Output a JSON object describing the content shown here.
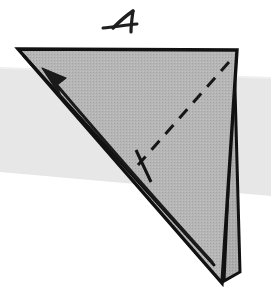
{
  "figure": {
    "title": "Origami fold step 4",
    "step_label": "4",
    "step_label_style": "hand-drawn-numeral",
    "background_color": "#ffffff"
  },
  "colors": {
    "paper_front": "#b3b3b3",
    "paper_front_light": "#bdbdbd",
    "paper_sliver": "#adadad",
    "outline": "#111111",
    "band": "#e7e7e7",
    "band_edge": "#ededed",
    "arrow": "#1a1a1a",
    "crease_dashed": "#161616",
    "label_ink": "#1f1f1f"
  },
  "geometry": {
    "canvas_width": 271,
    "canvas_height": 308,
    "main_triangle": {
      "name": "folded-paper-main-face",
      "points": "18,49 237,50 222,283",
      "description": "Large gray right-triangle shaped folded paper, apex top-left, top-right corner, lower point near bottom"
    },
    "sliver_layer": {
      "name": "folded-paper-back-layer",
      "points": "234,52 240,272 224,281",
      "description": "Narrow second paper layer peeking along right edge, tip at bottom right"
    },
    "inner_edge": {
      "name": "folded-paper-inner-crease-edge",
      "points": "24,56 214,265",
      "description": "Long straight edge from near top-left apex to lower point, delimiting the flap"
    },
    "band": {
      "name": "background-gray-band",
      "top_left_y": 68,
      "top_right_y": 78,
      "bottom_left_y": 172,
      "bottom_right_y": 196,
      "description": "Horizontal pale gray band passing behind the model, sloping slightly downward to the right"
    },
    "dashed_crease": {
      "name": "valley-fold-dashed-line",
      "from": "229,62",
      "to": "138,165",
      "dash_pattern": "12 9",
      "width": 3
    },
    "tick_mark": {
      "name": "fold-reference-tick",
      "from": "136,150",
      "to": "151,182",
      "width": 3
    },
    "arrow": {
      "name": "fold-direction-arrow",
      "path": "M 212,262 C 160,205 95,130 49,76",
      "head_tip": "42,68",
      "head_points": "42,68 66,78 57,85 61,97",
      "width": 3,
      "direction": "up-left"
    },
    "step_label": {
      "name": "step-number-4",
      "x": 100,
      "y": 6,
      "width": 64,
      "height": 30,
      "strokes": [
        "M 13,22 C 20,15 27,9 33,5",
        "M 33,5 C 32,12 31,19 31,26",
        "M 3,22 C 14,21 26,19 37,18",
        "M 37,18 C 45,17 53,18 60,20"
      ]
    }
  }
}
